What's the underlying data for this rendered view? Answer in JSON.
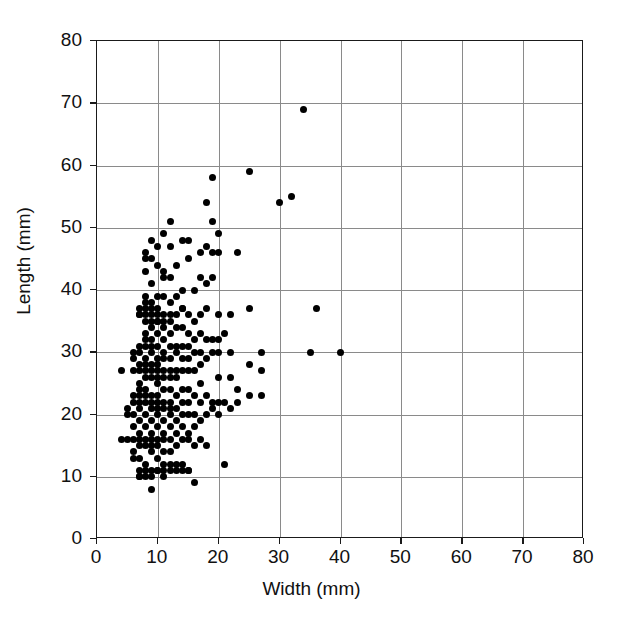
{
  "chart_data": {
    "type": "scatter",
    "title": "",
    "xlabel": "Width (mm)",
    "ylabel": "Length (mm)",
    "xlim": [
      0,
      80
    ],
    "ylim": [
      0,
      80
    ],
    "xticks": [
      0,
      10,
      20,
      30,
      40,
      50,
      60,
      70,
      80
    ],
    "yticks": [
      0,
      10,
      20,
      30,
      40,
      50,
      60,
      70,
      80
    ],
    "xtick_labels": [
      "0",
      "10",
      "20",
      "30",
      "40",
      "50",
      "60",
      "70",
      "80"
    ],
    "ytick_labels": [
      "0",
      "10",
      "20",
      "30",
      "40",
      "50",
      "60",
      "70",
      "80"
    ],
    "grid": true,
    "grid_color": "#8a8a8a",
    "legend": null,
    "marker_color": "#000000",
    "marker_shape": "circle",
    "n_points": 219,
    "series": [
      {
        "name": "specimens",
        "points": [
          [
            4,
            27
          ],
          [
            4,
            16
          ],
          [
            5,
            21
          ],
          [
            5,
            20
          ],
          [
            5,
            16
          ],
          [
            6,
            30
          ],
          [
            6,
            29
          ],
          [
            6,
            27
          ],
          [
            6,
            23
          ],
          [
            6,
            22
          ],
          [
            6,
            20
          ],
          [
            6,
            18
          ],
          [
            6,
            16
          ],
          [
            6,
            14
          ],
          [
            6,
            13
          ],
          [
            7,
            37
          ],
          [
            7,
            36
          ],
          [
            7,
            36
          ],
          [
            7,
            31
          ],
          [
            7,
            30
          ],
          [
            7,
            28
          ],
          [
            7,
            27
          ],
          [
            7,
            25
          ],
          [
            7,
            24
          ],
          [
            7,
            23
          ],
          [
            7,
            22
          ],
          [
            7,
            21
          ],
          [
            7,
            19
          ],
          [
            7,
            17
          ],
          [
            7,
            16
          ],
          [
            7,
            15
          ],
          [
            7,
            13
          ],
          [
            7,
            11
          ],
          [
            7,
            10
          ],
          [
            7,
            10
          ],
          [
            8,
            46
          ],
          [
            8,
            45
          ],
          [
            8,
            43
          ],
          [
            8,
            39
          ],
          [
            8,
            38
          ],
          [
            8,
            37
          ],
          [
            8,
            36
          ],
          [
            8,
            35
          ],
          [
            8,
            33
          ],
          [
            8,
            32
          ],
          [
            8,
            31
          ],
          [
            8,
            29
          ],
          [
            8,
            28
          ],
          [
            8,
            27
          ],
          [
            8,
            26
          ],
          [
            8,
            24
          ],
          [
            8,
            23
          ],
          [
            8,
            22
          ],
          [
            8,
            20
          ],
          [
            8,
            18
          ],
          [
            8,
            16
          ],
          [
            8,
            15
          ],
          [
            8,
            12
          ],
          [
            8,
            11
          ],
          [
            8,
            10
          ],
          [
            9,
            48
          ],
          [
            9,
            45
          ],
          [
            9,
            41
          ],
          [
            9,
            38
          ],
          [
            9,
            37
          ],
          [
            9,
            36
          ],
          [
            9,
            35
          ],
          [
            9,
            34
          ],
          [
            9,
            32
          ],
          [
            9,
            31
          ],
          [
            9,
            30
          ],
          [
            9,
            28
          ],
          [
            9,
            27
          ],
          [
            9,
            26
          ],
          [
            9,
            23
          ],
          [
            9,
            22
          ],
          [
            9,
            21
          ],
          [
            9,
            19
          ],
          [
            9,
            17
          ],
          [
            9,
            16
          ],
          [
            9,
            15
          ],
          [
            9,
            14
          ],
          [
            9,
            11
          ],
          [
            9,
            10
          ],
          [
            9,
            8
          ],
          [
            10,
            47
          ],
          [
            10,
            44
          ],
          [
            10,
            39
          ],
          [
            10,
            37
          ],
          [
            10,
            36
          ],
          [
            10,
            35
          ],
          [
            10,
            35
          ],
          [
            10,
            33
          ],
          [
            10,
            31
          ],
          [
            10,
            29
          ],
          [
            10,
            28
          ],
          [
            10,
            27
          ],
          [
            10,
            26
          ],
          [
            10,
            25
          ],
          [
            10,
            23
          ],
          [
            10,
            22
          ],
          [
            10,
            21
          ],
          [
            10,
            20
          ],
          [
            10,
            18
          ],
          [
            10,
            16
          ],
          [
            10,
            15
          ],
          [
            10,
            13
          ],
          [
            10,
            11
          ],
          [
            10,
            11
          ],
          [
            11,
            49
          ],
          [
            11,
            43
          ],
          [
            11,
            42
          ],
          [
            11,
            39
          ],
          [
            11,
            36
          ],
          [
            11,
            35
          ],
          [
            11,
            34
          ],
          [
            11,
            32
          ],
          [
            11,
            30
          ],
          [
            11,
            29
          ],
          [
            11,
            27
          ],
          [
            11,
            26
          ],
          [
            11,
            24
          ],
          [
            11,
            22
          ],
          [
            11,
            21
          ],
          [
            11,
            19
          ],
          [
            11,
            17
          ],
          [
            11,
            16
          ],
          [
            11,
            14
          ],
          [
            11,
            12
          ],
          [
            11,
            11
          ],
          [
            11,
            10
          ],
          [
            12,
            51
          ],
          [
            12,
            47
          ],
          [
            12,
            42
          ],
          [
            12,
            38
          ],
          [
            12,
            36
          ],
          [
            12,
            35
          ],
          [
            12,
            33
          ],
          [
            12,
            31
          ],
          [
            12,
            29
          ],
          [
            12,
            27
          ],
          [
            12,
            26
          ],
          [
            12,
            24
          ],
          [
            12,
            22
          ],
          [
            12,
            21
          ],
          [
            12,
            20
          ],
          [
            12,
            18
          ],
          [
            12,
            16
          ],
          [
            12,
            14
          ],
          [
            12,
            12
          ],
          [
            12,
            11
          ],
          [
            13,
            44
          ],
          [
            13,
            39
          ],
          [
            13,
            36
          ],
          [
            13,
            34
          ],
          [
            13,
            31
          ],
          [
            13,
            30
          ],
          [
            13,
            27
          ],
          [
            13,
            26
          ],
          [
            13,
            23
          ],
          [
            13,
            21
          ],
          [
            13,
            19
          ],
          [
            13,
            17
          ],
          [
            13,
            15
          ],
          [
            13,
            12
          ],
          [
            13,
            11
          ],
          [
            14,
            48
          ],
          [
            14,
            40
          ],
          [
            14,
            37
          ],
          [
            14,
            37
          ],
          [
            14,
            34
          ],
          [
            14,
            31
          ],
          [
            14,
            29
          ],
          [
            14,
            27
          ],
          [
            14,
            24
          ],
          [
            14,
            22
          ],
          [
            14,
            20
          ],
          [
            14,
            18
          ],
          [
            14,
            16
          ],
          [
            14,
            12
          ],
          [
            14,
            11
          ],
          [
            15,
            48
          ],
          [
            15,
            45
          ],
          [
            15,
            36
          ],
          [
            15,
            33
          ],
          [
            15,
            31
          ],
          [
            15,
            29
          ],
          [
            15,
            27
          ],
          [
            15,
            24
          ],
          [
            15,
            22
          ],
          [
            15,
            20
          ],
          [
            15,
            17
          ],
          [
            15,
            16
          ],
          [
            15,
            11
          ],
          [
            15,
            11
          ],
          [
            16,
            40
          ],
          [
            16,
            35
          ],
          [
            16,
            32
          ],
          [
            16,
            30
          ],
          [
            16,
            27
          ],
          [
            16,
            23
          ],
          [
            16,
            20
          ],
          [
            16,
            18
          ],
          [
            16,
            15
          ],
          [
            16,
            9
          ],
          [
            17,
            46
          ],
          [
            17,
            42
          ],
          [
            17,
            36
          ],
          [
            17,
            33
          ],
          [
            17,
            30
          ],
          [
            17,
            28
          ],
          [
            17,
            25
          ],
          [
            17,
            22
          ],
          [
            17,
            19
          ],
          [
            17,
            16
          ],
          [
            18,
            54
          ],
          [
            18,
            47
          ],
          [
            18,
            41
          ],
          [
            18,
            37
          ],
          [
            18,
            32
          ],
          [
            18,
            29
          ],
          [
            18,
            23
          ],
          [
            18,
            20
          ],
          [
            18,
            15
          ],
          [
            19,
            58
          ],
          [
            19,
            51
          ],
          [
            19,
            46
          ],
          [
            19,
            42
          ],
          [
            19,
            32
          ],
          [
            19,
            30
          ],
          [
            19,
            22
          ],
          [
            19,
            21
          ],
          [
            20,
            49
          ],
          [
            20,
            46
          ],
          [
            20,
            36
          ],
          [
            20,
            32
          ],
          [
            20,
            30
          ],
          [
            20,
            26
          ],
          [
            20,
            22
          ],
          [
            20,
            20
          ],
          [
            21,
            33
          ],
          [
            21,
            22
          ],
          [
            21,
            12
          ],
          [
            22,
            36
          ],
          [
            22,
            30
          ],
          [
            22,
            26
          ],
          [
            22,
            21
          ],
          [
            23,
            46
          ],
          [
            23,
            24
          ],
          [
            23,
            22
          ],
          [
            25,
            59
          ],
          [
            25,
            37
          ],
          [
            25,
            28
          ],
          [
            25,
            23
          ],
          [
            27,
            30
          ],
          [
            27,
            27
          ],
          [
            27,
            23
          ],
          [
            30,
            54
          ],
          [
            32,
            55
          ],
          [
            34,
            69
          ],
          [
            35,
            30
          ],
          [
            36,
            37
          ],
          [
            40,
            30
          ]
        ]
      }
    ]
  },
  "axes": {
    "x": {
      "title": "Width (mm)",
      "ticks": [
        "0",
        "10",
        "20",
        "30",
        "40",
        "50",
        "60",
        "70",
        "80"
      ]
    },
    "y": {
      "title": "Length (mm)",
      "ticks": [
        "0",
        "10",
        "20",
        "30",
        "40",
        "50",
        "60",
        "70",
        "80"
      ]
    }
  }
}
